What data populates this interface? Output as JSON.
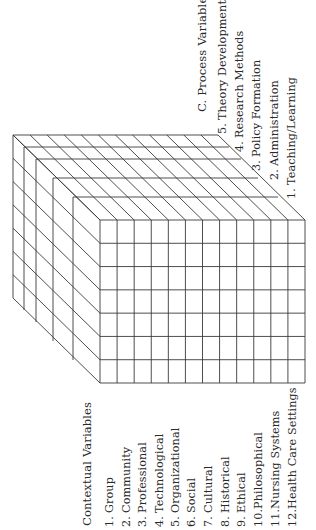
{
  "diagram": {
    "orientation": "rotated-90-ccw",
    "line_color": "#3a3a3a",
    "background": "#ffffff",
    "cube": {
      "front_columns": 12,
      "front_rows": 7,
      "depth_layers": 5
    }
  },
  "contextual": {
    "heading": "Contextual Variables",
    "items": [
      {
        "num": "1.",
        "label": "Group"
      },
      {
        "num": "2.",
        "label": "Community"
      },
      {
        "num": "3.",
        "label": "Professional"
      },
      {
        "num": "4.",
        "label": "Technological"
      },
      {
        "num": "5.",
        "label": "Organizational"
      },
      {
        "num": "6.",
        "label": "Social"
      },
      {
        "num": "7.",
        "label": "Cultural"
      },
      {
        "num": "8.",
        "label": "Historical"
      },
      {
        "num": "9.",
        "label": "Ethical"
      },
      {
        "num": "10.",
        "label": "Philosophical"
      },
      {
        "num": "11.",
        "label": "Nursing Systems"
      },
      {
        "num": "12.",
        "label": "Health Care Settings"
      }
    ]
  },
  "process": {
    "heading": "C. Process Variables",
    "items": [
      {
        "num": "5.",
        "label": "Theory Development"
      },
      {
        "num": "4.",
        "label": "Research Methods"
      },
      {
        "num": "3.",
        "label": "Policy Formation"
      },
      {
        "num": "2.",
        "label": "Administration"
      },
      {
        "num": "1.",
        "label": "Teaching/Learning"
      }
    ]
  }
}
